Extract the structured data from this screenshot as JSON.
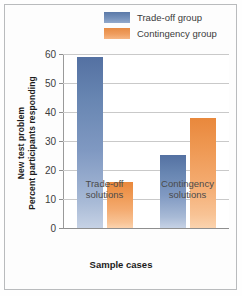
{
  "chart_data": {
    "type": "bar",
    "title": "",
    "subtitle": "",
    "xlabel": "Sample cases",
    "ylabel_line1": "New test problem",
    "ylabel_line2": "Percent participants responding",
    "categories": [
      "Trade-off solutions",
      "Contingency solutions"
    ],
    "category_lines": [
      [
        "Trade-off",
        "solutions"
      ],
      [
        "Contingency",
        "solutions"
      ]
    ],
    "series": [
      {
        "name": "Trade-off group",
        "color": "#6886b2",
        "values": [
          59,
          25
        ]
      },
      {
        "name": "Contingency group",
        "color": "#ef9a55",
        "values": [
          16,
          38
        ]
      }
    ],
    "ylim": [
      0,
      60
    ],
    "yticks": [
      0,
      10,
      20,
      30,
      40,
      50,
      60
    ],
    "ytick_labels": [
      "0",
      "10",
      "20",
      "30",
      "40",
      "50",
      "60"
    ],
    "grid": true,
    "legend_position": "top-right"
  },
  "legend": {
    "items": [
      {
        "label": "Trade-off group",
        "swatch": "blue"
      },
      {
        "label": "Contingency group",
        "swatch": "orange"
      }
    ]
  }
}
